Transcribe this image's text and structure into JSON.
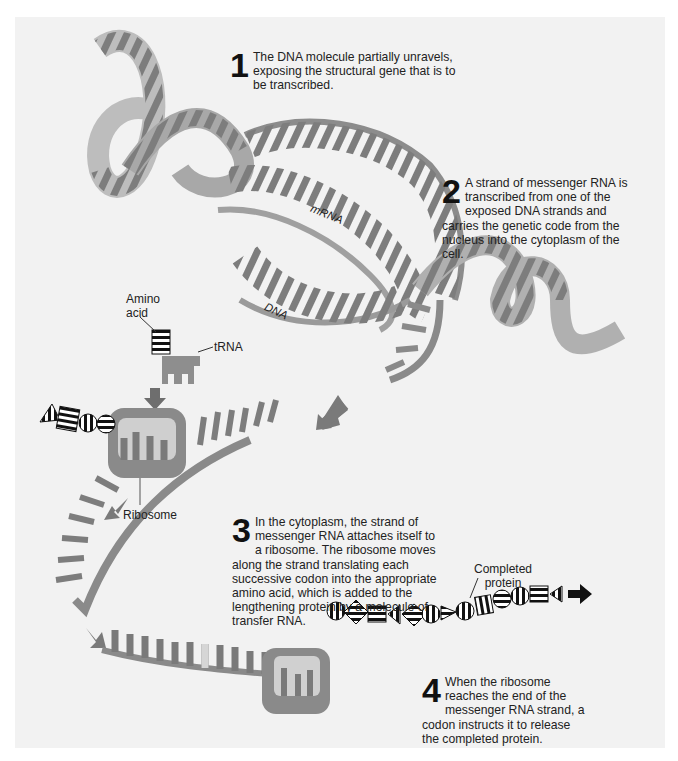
{
  "figure": {
    "steps": [
      {
        "number": "1",
        "text": "The DNA molecule partially unravels, exposing the structural gene that is to be transcribed."
      },
      {
        "number": "2",
        "text": "A strand of messenger RNA is transcribed from one of the exposed DNA strands and carries the genetic code from the nucleus into the cytoplasm of the cell."
      },
      {
        "number": "3",
        "text": "In the cytoplasm, the strand of messenger RNA attaches itself to a ribosome. The ribosome moves along the strand translating each successive codon into the appropriate amino acid, which is added to the lengthening protein by a molecule of transfer RNA."
      },
      {
        "number": "4",
        "text": "When the ribosome reaches the end of the messenger RNA strand, a codon instructs it to release the completed protein."
      }
    ],
    "labels": {
      "mrna": "mRNA",
      "dna": "DNA",
      "amino_acid": "Amino acid",
      "amino_line1": "Amino",
      "amino_line2": "acid",
      "trna": "tRNA",
      "ribosome": "Ribosome",
      "completed_protein_line1": "Completed",
      "completed_protein_line2": "protein"
    },
    "colors": {
      "panel_bg": "#f2f2f2",
      "helix_dark": "#6e6e6e",
      "helix_mid": "#9a9a9a",
      "helix_light": "#c8c8c8",
      "arrow": "#7a7a7a",
      "ribosome": "#8a8a8a"
    }
  }
}
